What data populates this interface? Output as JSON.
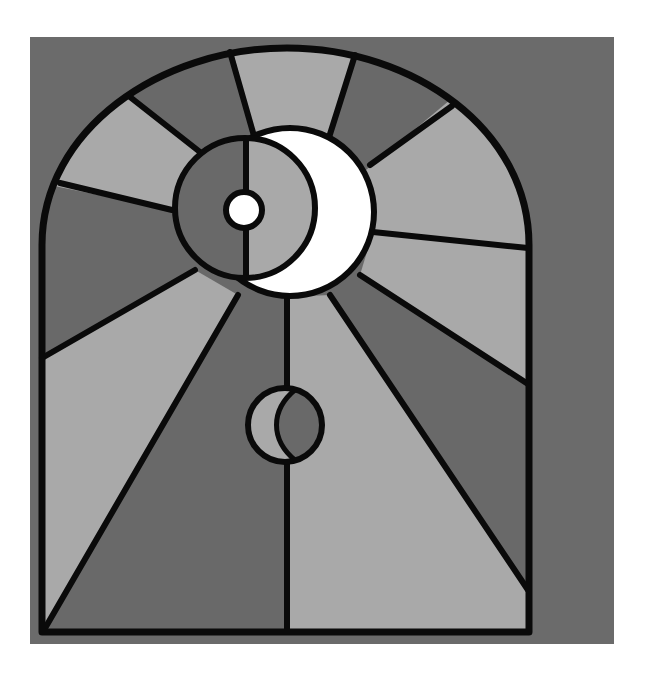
{
  "artwork": {
    "title": "Stained glass window with sun and moons",
    "colors": {
      "page_bg": "#ffffff",
      "frame_bg": "#6b6b6b",
      "dark_glass": "#696969",
      "light_glass": "#a9a9a9",
      "white_glass": "#ffffff",
      "lead": "#0a0a0a"
    },
    "elements": [
      "arched-window",
      "radiating-rays",
      "crescent-moon",
      "inner-circle",
      "small-sun",
      "small-moon",
      "center-divider"
    ]
  }
}
